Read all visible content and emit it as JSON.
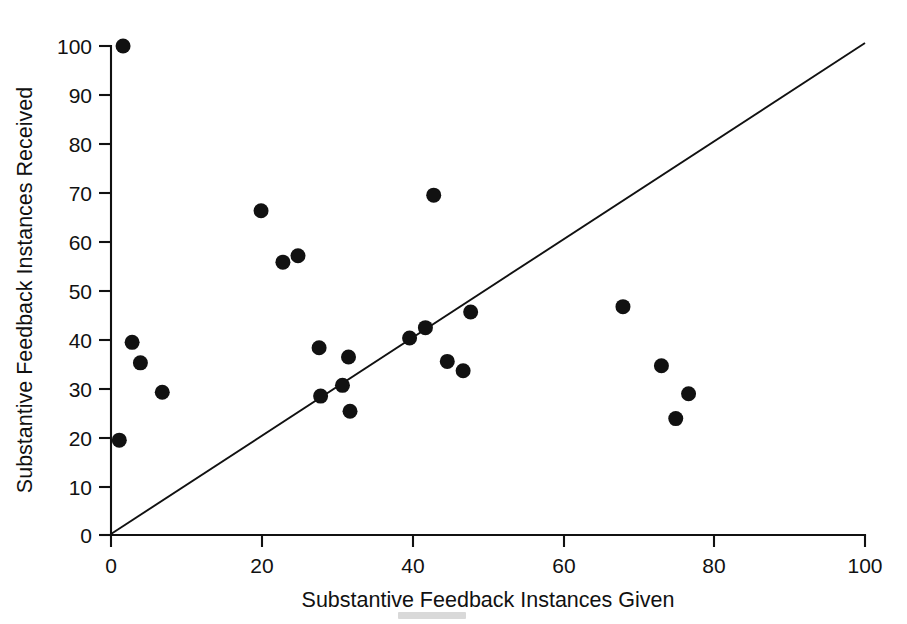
{
  "chart_data": {
    "type": "scatter",
    "title": "",
    "xlabel": "Substantive Feedback Instances Given",
    "ylabel": "Substantive Feedback Instances Received",
    "xlim": [
      0,
      100
    ],
    "ylim": [
      0,
      100
    ],
    "xticks": [
      0,
      20,
      40,
      60,
      80,
      100
    ],
    "yticks": [
      0,
      10,
      20,
      30,
      40,
      50,
      60,
      70,
      80,
      90,
      100
    ],
    "xtick_labels": [
      "0",
      "20",
      "40",
      "60",
      "80",
      "100"
    ],
    "ytick_labels": [
      "0",
      "10",
      "20",
      "30",
      "40",
      "50",
      "60",
      "70",
      "80",
      "90",
      "100"
    ],
    "grid": false,
    "legend": null,
    "marker": {
      "shape": "circle",
      "color": "#111111",
      "size_px": 15
    },
    "points": [
      {
        "x": 1.6,
        "y": 100.0
      },
      {
        "x": 1.1,
        "y": 19.4
      },
      {
        "x": 2.8,
        "y": 39.4
      },
      {
        "x": 3.9,
        "y": 35.2
      },
      {
        "x": 6.8,
        "y": 29.2
      },
      {
        "x": 19.9,
        "y": 66.3
      },
      {
        "x": 22.8,
        "y": 55.8
      },
      {
        "x": 24.8,
        "y": 57.1
      },
      {
        "x": 27.6,
        "y": 38.3
      },
      {
        "x": 27.8,
        "y": 28.4
      },
      {
        "x": 30.7,
        "y": 30.6
      },
      {
        "x": 31.5,
        "y": 36.4
      },
      {
        "x": 31.7,
        "y": 25.3
      },
      {
        "x": 39.6,
        "y": 40.3
      },
      {
        "x": 41.7,
        "y": 42.4
      },
      {
        "x": 42.8,
        "y": 69.5
      },
      {
        "x": 44.6,
        "y": 35.5
      },
      {
        "x": 46.7,
        "y": 33.6
      },
      {
        "x": 47.7,
        "y": 45.6
      },
      {
        "x": 67.9,
        "y": 46.7
      },
      {
        "x": 73.0,
        "y": 34.6
      },
      {
        "x": 74.9,
        "y": 23.8
      },
      {
        "x": 76.6,
        "y": 28.9
      }
    ],
    "reference_line": {
      "description": "diagonal identity reference line",
      "x0": 0,
      "y0": 0,
      "x1": 100,
      "y1": 102.5
    }
  }
}
